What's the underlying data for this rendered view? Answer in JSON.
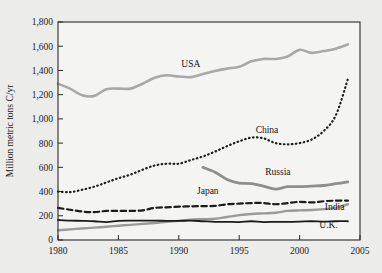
{
  "chart_data": {
    "type": "line",
    "title": "",
    "xlabel": "",
    "ylabel": "Million metric tons C/yr",
    "xlim": [
      1980,
      2005
    ],
    "ylim": [
      0,
      1800
    ],
    "grid": false,
    "legend_position": "inline-labels",
    "x_ticks": [
      "1980",
      "1985",
      "1990",
      "1995",
      "2000",
      "2005"
    ],
    "x_tick_values": [
      1980,
      1985,
      1990,
      1995,
      2000,
      2005
    ],
    "y_ticks": [
      "0",
      "200",
      "400",
      "600",
      "800",
      "1,000",
      "1,200",
      "1,400",
      "1,600",
      "1,800"
    ],
    "y_tick_values": [
      0,
      200,
      400,
      600,
      800,
      1000,
      1200,
      1400,
      1600,
      1800
    ],
    "series": [
      {
        "name": "USA",
        "label": "USA",
        "style": "solid",
        "color": "#a8a8a8",
        "width": 2.6,
        "x": [
          1980,
          1981,
          1982,
          1983,
          1984,
          1985,
          1986,
          1987,
          1988,
          1989,
          1990,
          1991,
          1992,
          1993,
          1994,
          1995,
          1996,
          1997,
          1998,
          1999,
          2000,
          2001,
          2002,
          2003,
          2004
        ],
        "values": [
          1290,
          1250,
          1195,
          1190,
          1245,
          1250,
          1250,
          1290,
          1340,
          1360,
          1350,
          1345,
          1370,
          1395,
          1415,
          1430,
          1475,
          1495,
          1495,
          1515,
          1570,
          1545,
          1560,
          1580,
          1615
        ]
      },
      {
        "name": "China",
        "label": "China",
        "style": "dotted",
        "color": "#1b1b1b",
        "width": 2.2,
        "x": [
          1980,
          1981,
          1982,
          1983,
          1984,
          1985,
          1986,
          1987,
          1988,
          1989,
          1990,
          1991,
          1992,
          1993,
          1994,
          1995,
          1996,
          1997,
          1998,
          1999,
          2000,
          2001,
          2002,
          2003,
          2004
        ],
        "values": [
          400,
          395,
          415,
          440,
          475,
          510,
          540,
          580,
          615,
          630,
          630,
          660,
          690,
          730,
          775,
          815,
          845,
          840,
          800,
          790,
          800,
          830,
          900,
          1030,
          1330
        ]
      },
      {
        "name": "Russia",
        "label": "Russia",
        "style": "solid",
        "color": "#8e8e8e",
        "width": 2.8,
        "x": [
          1992,
          1993,
          1994,
          1995,
          1996,
          1997,
          1998,
          1999,
          2000,
          2001,
          2002,
          2003,
          2004
        ],
        "values": [
          600,
          560,
          500,
          470,
          465,
          445,
          420,
          440,
          440,
          445,
          450,
          465,
          480
        ]
      },
      {
        "name": "Japan",
        "label": "Japan",
        "style": "dashed",
        "color": "#1b1b1b",
        "width": 2.2,
        "x": [
          1980,
          1981,
          1982,
          1983,
          1984,
          1985,
          1986,
          1987,
          1988,
          1989,
          1990,
          1991,
          1992,
          1993,
          1994,
          1995,
          1996,
          1997,
          1998,
          1999,
          2000,
          2001,
          2002,
          2003,
          2004
        ],
        "values": [
          265,
          250,
          235,
          230,
          240,
          240,
          240,
          245,
          265,
          270,
          275,
          278,
          280,
          282,
          295,
          300,
          305,
          305,
          295,
          305,
          315,
          310,
          320,
          325,
          325
        ]
      },
      {
        "name": "India",
        "label": "India",
        "style": "solid",
        "color": "#9a9a9a",
        "width": 2.4,
        "x": [
          1980,
          1981,
          1982,
          1983,
          1984,
          1985,
          1986,
          1987,
          1988,
          1989,
          1990,
          1991,
          1992,
          1993,
          1994,
          1995,
          1996,
          1997,
          1998,
          1999,
          2000,
          2001,
          2002,
          2003,
          2004
        ],
        "values": [
          80,
          88,
          95,
          102,
          110,
          118,
          125,
          133,
          140,
          150,
          158,
          168,
          172,
          175,
          190,
          205,
          215,
          220,
          225,
          240,
          245,
          248,
          255,
          265,
          295
        ]
      },
      {
        "name": "U.K.",
        "label": "U.K.",
        "style": "solid",
        "color": "#1b1b1b",
        "width": 1.8,
        "x": [
          1980,
          1981,
          1982,
          1983,
          1984,
          1985,
          1986,
          1987,
          1988,
          1989,
          1990,
          1991,
          1992,
          1993,
          1994,
          1995,
          1996,
          1997,
          1998,
          1999,
          2000,
          2001,
          2002,
          2003,
          2004
        ],
        "values": [
          165,
          160,
          158,
          155,
          148,
          158,
          160,
          160,
          160,
          158,
          158,
          160,
          155,
          150,
          150,
          148,
          155,
          148,
          150,
          150,
          152,
          155,
          152,
          155,
          155
        ]
      }
    ],
    "annotations": [
      {
        "text": "USA",
        "x": 1991.0,
        "y": 1425
      },
      {
        "text": "China",
        "x": 1997.3,
        "y": 880
      },
      {
        "text": "Russia",
        "x": 1998.2,
        "y": 535
      },
      {
        "text": "Japan",
        "x": 1992.4,
        "y": 380
      },
      {
        "text": "India",
        "x": 2002.9,
        "y": 250
      },
      {
        "text": "U.K.",
        "x": 2002.4,
        "y": 95
      }
    ]
  }
}
